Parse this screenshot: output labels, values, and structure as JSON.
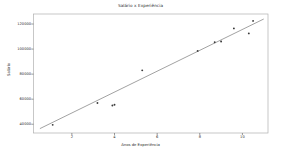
{
  "chart_data": {
    "type": "scatter",
    "title": "Salário x Experiência",
    "xlabel": "Anos de Experiência",
    "ylabel": "Salário",
    "xlim": [
      0.2,
      11.2
    ],
    "ylim": [
      33000,
      128000
    ],
    "grid": false,
    "legend": null,
    "xticks": [
      2,
      4,
      6,
      8,
      10
    ],
    "xtick_labels": [
      "2",
      "4",
      "6",
      "8",
      "10"
    ],
    "yticks": [
      40000,
      60000,
      80000,
      100000,
      120000
    ],
    "ytick_labels": [
      "40000",
      "60000",
      "80000",
      "100000",
      "120000"
    ],
    "series": [
      {
        "name": "Salário observado",
        "type": "scatter",
        "marker": "point",
        "color": "#3a3a3a",
        "x": [
          1.1,
          3.2,
          3.9,
          4.0,
          5.3,
          7.9,
          8.7,
          9.0,
          9.6,
          10.3,
          10.5
        ],
        "y": [
          39500,
          57000,
          55000,
          55500,
          83000,
          98500,
          105500,
          106000,
          116500,
          112500,
          122500
        ]
      },
      {
        "name": "Regressão linear",
        "type": "line",
        "color": "#555555",
        "x": [
          0.5,
          11.0
        ],
        "y": [
          36500,
          124000
        ]
      }
    ]
  },
  "figure": {
    "facecolor": "#ffffff",
    "axes_edgecolor": "#b0b0b0",
    "tick_color": "#555555",
    "text_color": "#2b2b2b"
  }
}
